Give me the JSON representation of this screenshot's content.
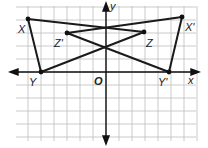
{
  "diagram": {
    "type": "coordinate-plane-triangles",
    "axes": {
      "x_label": "x",
      "y_label": "y",
      "origin_label": "O"
    },
    "grid": {
      "cell_px": 13,
      "left": 16,
      "top": 6,
      "right": 198,
      "bottom": 141,
      "origin_px": [
        106,
        72
      ],
      "line_color": "#b8b8b8"
    },
    "points": [
      {
        "name": "X",
        "label": "X",
        "px": [
          28,
          19
        ]
      },
      {
        "name": "X'",
        "label": "X'",
        "px": [
          182,
          17
        ]
      },
      {
        "name": "Z'",
        "label": "Z'",
        "px": [
          67,
          33
        ]
      },
      {
        "name": "Z",
        "label": "Z",
        "px": [
          144,
          32
        ]
      },
      {
        "name": "Y",
        "label": "Y",
        "px": [
          41,
          72
        ]
      },
      {
        "name": "Y'",
        "label": "Y'",
        "px": [
          169,
          72
        ]
      }
    ],
    "triangles": [
      {
        "name": "XYZ",
        "vertices": [
          "X",
          "Y",
          "Z"
        ]
      },
      {
        "name": "X'Y'Z'",
        "vertices": [
          "X'",
          "Y'",
          "Z'"
        ]
      }
    ],
    "stroke_color": "#1a1a1a"
  },
  "labels": {
    "x": "x",
    "y": "y",
    "o": "O",
    "X": "X",
    "Xp": "X'",
    "Z": "Z",
    "Zp": "Z'",
    "Y": "Y",
    "Yp": "Y'"
  }
}
